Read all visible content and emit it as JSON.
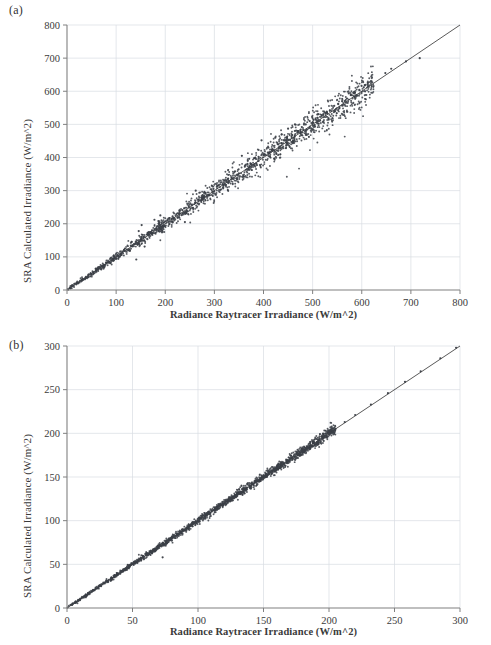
{
  "figure": {
    "background": "#ffffff",
    "axis_color": "#808080",
    "grid_color": "#d8dde3",
    "point_color": "#3b3f47",
    "line_color": "#2f2f2f"
  },
  "panels": [
    {
      "key": "a",
      "label": "(a)",
      "chart_data": {
        "type": "scatter",
        "title": "",
        "xlabel": "Radiance Raytracer Irradiance (W/m^2)",
        "ylabel": "SRA Calculated Irradiance (W/m^2)",
        "xlim": [
          0,
          800
        ],
        "ylim": [
          0,
          800
        ],
        "xticks": [
          0,
          100,
          200,
          300,
          400,
          500,
          600,
          700,
          800
        ],
        "yticks": [
          0,
          100,
          200,
          300,
          400,
          500,
          600,
          700,
          800
        ],
        "grid": true,
        "legend": "none",
        "reference_line": {
          "type": "identity",
          "from": [
            0,
            0
          ],
          "to": [
            800,
            800
          ],
          "label": "1:1 line"
        },
        "scatter_description": "Dense cloud of points following the 1:1 diagonal with increasing spread above ~100 W/m^2; most data between 0 and 620 W/m^2 with a few isolated outliers near 720 W/m^2.",
        "n_points": 1400,
        "points_sample": [
          [
            10,
            11
          ],
          [
            22,
            20
          ],
          [
            35,
            33
          ],
          [
            48,
            50
          ],
          [
            60,
            58
          ],
          [
            72,
            74
          ],
          [
            85,
            83
          ],
          [
            96,
            100
          ],
          [
            110,
            108
          ],
          [
            118,
            125
          ],
          [
            128,
            119
          ],
          [
            140,
            146
          ],
          [
            141,
            92
          ],
          [
            146,
            178
          ],
          [
            150,
            152
          ],
          [
            152,
            196
          ],
          [
            158,
            131
          ],
          [
            163,
            168
          ],
          [
            170,
            175
          ],
          [
            178,
            212
          ],
          [
            182,
            186
          ],
          [
            186,
            208
          ],
          [
            190,
            225
          ],
          [
            196,
            192
          ],
          [
            205,
            210
          ],
          [
            215,
            222
          ],
          [
            225,
            218
          ],
          [
            235,
            241
          ],
          [
            240,
            205
          ],
          [
            248,
            253
          ],
          [
            255,
            248
          ],
          [
            262,
            300
          ],
          [
            268,
            272
          ],
          [
            275,
            280
          ],
          [
            282,
            291
          ],
          [
            290,
            286
          ],
          [
            298,
            305
          ],
          [
            305,
            312
          ],
          [
            312,
            302
          ],
          [
            320,
            330
          ],
          [
            328,
            336
          ],
          [
            335,
            340
          ],
          [
            342,
            358
          ],
          [
            350,
            352
          ],
          [
            356,
            405
          ],
          [
            362,
            372
          ],
          [
            368,
            390
          ],
          [
            375,
            380
          ],
          [
            382,
            398
          ],
          [
            390,
            402
          ],
          [
            396,
            452
          ],
          [
            402,
            410
          ],
          [
            410,
            430
          ],
          [
            418,
            425
          ],
          [
            424,
            460
          ],
          [
            430,
            440
          ],
          [
            437,
            470
          ],
          [
            444,
            452
          ],
          [
            450,
            487
          ],
          [
            458,
            468
          ],
          [
            464,
            500
          ],
          [
            470,
            478
          ],
          [
            478,
            492
          ],
          [
            486,
            500
          ],
          [
            494,
            510
          ],
          [
            500,
            505
          ],
          [
            510,
            520
          ],
          [
            518,
            528
          ],
          [
            527,
            534
          ],
          [
            535,
            541
          ],
          [
            544,
            556
          ],
          [
            552,
            562
          ],
          [
            560,
            570
          ],
          [
            570,
            578
          ],
          [
            578,
            588
          ],
          [
            586,
            596
          ],
          [
            595,
            604
          ],
          [
            604,
            612
          ],
          [
            612,
            620
          ],
          [
            620,
            630
          ],
          [
            648,
            655
          ],
          [
            660,
            668
          ],
          [
            690,
            690
          ],
          [
            718,
            700
          ]
        ]
      }
    },
    {
      "key": "b",
      "label": "(b)",
      "chart_data": {
        "type": "scatter",
        "title": "",
        "xlabel": "Radiance Raytracer Irradiance (W/m^2)",
        "ylabel": "SRA Calculated Irradiance (W/m^2)",
        "xlim": [
          0,
          300
        ],
        "ylim": [
          0,
          300
        ],
        "xticks": [
          0,
          50,
          100,
          150,
          200,
          250,
          300
        ],
        "yticks": [
          0,
          50,
          100,
          150,
          200,
          250,
          300
        ],
        "grid": true,
        "legend": "none",
        "reference_line": {
          "type": "identity",
          "from": [
            0,
            0
          ],
          "to": [
            300,
            300
          ],
          "label": "1:1 line"
        },
        "scatter_description": "Very tight band of points hugging the 1:1 diagonal from 0 to about 200 W/m^2, with slightly thicker clustering between 80 and 180 W/m^2; almost no visible scatter beyond 205 W/m^2.",
        "n_points": 1600,
        "points_sample": [
          [
            4,
            4
          ],
          [
            9,
            9
          ],
          [
            14,
            13
          ],
          [
            20,
            20
          ],
          [
            26,
            25
          ],
          [
            30,
            31
          ],
          [
            34,
            32
          ],
          [
            38,
            40
          ],
          [
            43,
            42
          ],
          [
            47,
            48
          ],
          [
            50,
            51
          ],
          [
            54,
            53
          ],
          [
            58,
            59
          ],
          [
            62,
            61
          ],
          [
            66,
            67
          ],
          [
            70,
            70
          ],
          [
            73,
            58
          ],
          [
            76,
            77
          ],
          [
            80,
            81
          ],
          [
            84,
            83
          ],
          [
            88,
            90
          ],
          [
            92,
            92
          ],
          [
            96,
            97
          ],
          [
            100,
            100
          ],
          [
            104,
            103
          ],
          [
            108,
            110
          ],
          [
            112,
            112
          ],
          [
            116,
            117
          ],
          [
            120,
            120
          ],
          [
            124,
            124
          ],
          [
            128,
            129
          ],
          [
            132,
            132
          ],
          [
            136,
            137
          ],
          [
            140,
            140
          ],
          [
            144,
            145
          ],
          [
            148,
            148
          ],
          [
            152,
            153
          ],
          [
            156,
            156
          ],
          [
            160,
            161
          ],
          [
            164,
            164
          ],
          [
            168,
            169
          ],
          [
            172,
            172
          ],
          [
            176,
            177
          ],
          [
            180,
            180
          ],
          [
            184,
            184
          ],
          [
            188,
            189
          ],
          [
            192,
            192
          ],
          [
            196,
            196
          ],
          [
            200,
            200
          ],
          [
            205,
            205
          ],
          [
            212,
            213
          ],
          [
            220,
            221
          ],
          [
            232,
            233
          ],
          [
            245,
            246
          ],
          [
            258,
            259
          ],
          [
            270,
            271
          ],
          [
            285,
            286
          ],
          [
            297,
            298
          ]
        ]
      }
    }
  ]
}
